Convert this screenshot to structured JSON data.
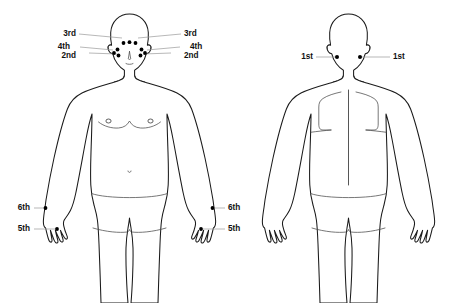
{
  "diagram": {
    "views": [
      {
        "name": "front",
        "caption": "Front view"
      },
      {
        "name": "back",
        "caption": "Back view"
      }
    ],
    "colors": {
      "background": "#ffffff",
      "outline": "#1a1a1a",
      "detail": "#4a4a4a",
      "dot": "#000000",
      "leader": "#9a9a9a",
      "label_text": "#111111"
    }
  },
  "labels": {
    "front": {
      "left": [
        {
          "id": "front-left-3rd",
          "text": "3rd",
          "x": 76,
          "y": 34
        },
        {
          "id": "front-left-4th",
          "text": "4th",
          "x": 70,
          "y": 47
        },
        {
          "id": "front-left-2nd",
          "text": "2nd",
          "x": 76,
          "y": 56
        }
      ],
      "right": [
        {
          "id": "front-right-3rd",
          "text": "3rd",
          "x": 184,
          "y": 34
        },
        {
          "id": "front-right-4th",
          "text": "4th",
          "x": 190,
          "y": 47
        },
        {
          "id": "front-right-2nd",
          "text": "2nd",
          "x": 184,
          "y": 56
        }
      ],
      "hand_left": [
        {
          "id": "front-left-6th",
          "text": "6th",
          "x": 30,
          "y": 208
        },
        {
          "id": "front-left-5th",
          "text": "5th",
          "x": 30,
          "y": 229
        }
      ],
      "hand_right": [
        {
          "id": "front-right-6th",
          "text": "6th",
          "x": 228,
          "y": 208
        },
        {
          "id": "front-right-5th",
          "text": "5th",
          "x": 228,
          "y": 229
        }
      ]
    },
    "back": {
      "left": [
        {
          "id": "back-left-1st",
          "text": "1st",
          "x": 313,
          "y": 57
        }
      ],
      "right": [
        {
          "id": "back-right-1st",
          "text": "1st",
          "x": 393,
          "y": 57
        }
      ]
    }
  },
  "sites": {
    "front_face": [
      {
        "id": "face-forehead-left",
        "cx": 123.5,
        "cy": 43.0,
        "r": 1.9,
        "group": "3rd"
      },
      {
        "id": "face-forehead-center",
        "cx": 129.5,
        "cy": 42.2,
        "r": 1.9,
        "group": "3rd"
      },
      {
        "id": "face-forehead-right",
        "cx": 135.5,
        "cy": 43.0,
        "r": 1.9,
        "group": "3rd"
      },
      {
        "id": "face-temple-left",
        "cx": 117.5,
        "cy": 49.5,
        "r": 1.9,
        "group": "4th"
      },
      {
        "id": "face-temple-right",
        "cx": 141.5,
        "cy": 49.5,
        "r": 1.9,
        "group": "4th"
      },
      {
        "id": "face-cheek-left",
        "cx": 118.5,
        "cy": 55.5,
        "r": 1.9,
        "group": "2nd"
      },
      {
        "id": "face-cheek-right",
        "cx": 140.5,
        "cy": 55.5,
        "r": 1.9,
        "group": "2nd"
      },
      {
        "id": "face-jaw-left",
        "cx": 114.0,
        "cy": 53.0,
        "r": 1.9,
        "group": "4th"
      },
      {
        "id": "face-jaw-right",
        "cx": 145.0,
        "cy": 53.0,
        "r": 1.9,
        "group": "4th"
      }
    ],
    "front_hands": [
      {
        "id": "hand-left-wrist",
        "cx": 45.5,
        "cy": 208.0,
        "r": 1.9,
        "group": "6th"
      },
      {
        "id": "hand-left-web",
        "cx": 57.0,
        "cy": 229.0,
        "r": 1.9,
        "group": "5th"
      },
      {
        "id": "hand-right-wrist",
        "cx": 212.5,
        "cy": 208.0,
        "r": 1.9,
        "group": "6th"
      },
      {
        "id": "hand-right-web",
        "cx": 201.0,
        "cy": 229.0,
        "r": 1.9,
        "group": "5th"
      }
    ],
    "back_head": [
      {
        "id": "nape-left",
        "cx": 337.0,
        "cy": 57.0,
        "r": 2.0,
        "group": "1st"
      },
      {
        "id": "nape-right",
        "cx": 360.0,
        "cy": 57.0,
        "r": 2.0,
        "group": "1st"
      }
    ]
  },
  "leaders": {
    "front": [
      {
        "id": "leader-front-left-3rd",
        "x1": 79,
        "y1": 34,
        "x2": 122,
        "y2": 38
      },
      {
        "id": "leader-front-left-4th",
        "x1": 80,
        "y1": 47,
        "x2": 113,
        "y2": 50
      },
      {
        "id": "leader-front-left-2nd",
        "x1": 89,
        "y1": 53,
        "x2": 117,
        "y2": 54
      },
      {
        "id": "leader-front-right-3rd",
        "x1": 181,
        "y1": 34,
        "x2": 138,
        "y2": 38
      },
      {
        "id": "leader-front-right-4th",
        "x1": 180,
        "y1": 47,
        "x2": 147,
        "y2": 50
      },
      {
        "id": "leader-front-right-2nd",
        "x1": 171,
        "y1": 53,
        "x2": 143,
        "y2": 54
      },
      {
        "id": "leader-front-left-6th",
        "x1": 34,
        "y1": 208,
        "x2": 45,
        "y2": 208
      },
      {
        "id": "leader-front-left-5th",
        "x1": 34,
        "y1": 229,
        "x2": 57,
        "y2": 229
      },
      {
        "id": "leader-front-right-6th",
        "x1": 225,
        "y1": 208,
        "x2": 213,
        "y2": 208
      },
      {
        "id": "leader-front-right-5th",
        "x1": 225,
        "y1": 229,
        "x2": 201,
        "y2": 229
      }
    ],
    "back": [
      {
        "id": "leader-back-left-1st",
        "x1": 316,
        "y1": 57,
        "x2": 336,
        "y2": 57
      },
      {
        "id": "leader-back-right-1st",
        "x1": 390,
        "y1": 57,
        "x2": 361,
        "y2": 57
      }
    ]
  }
}
